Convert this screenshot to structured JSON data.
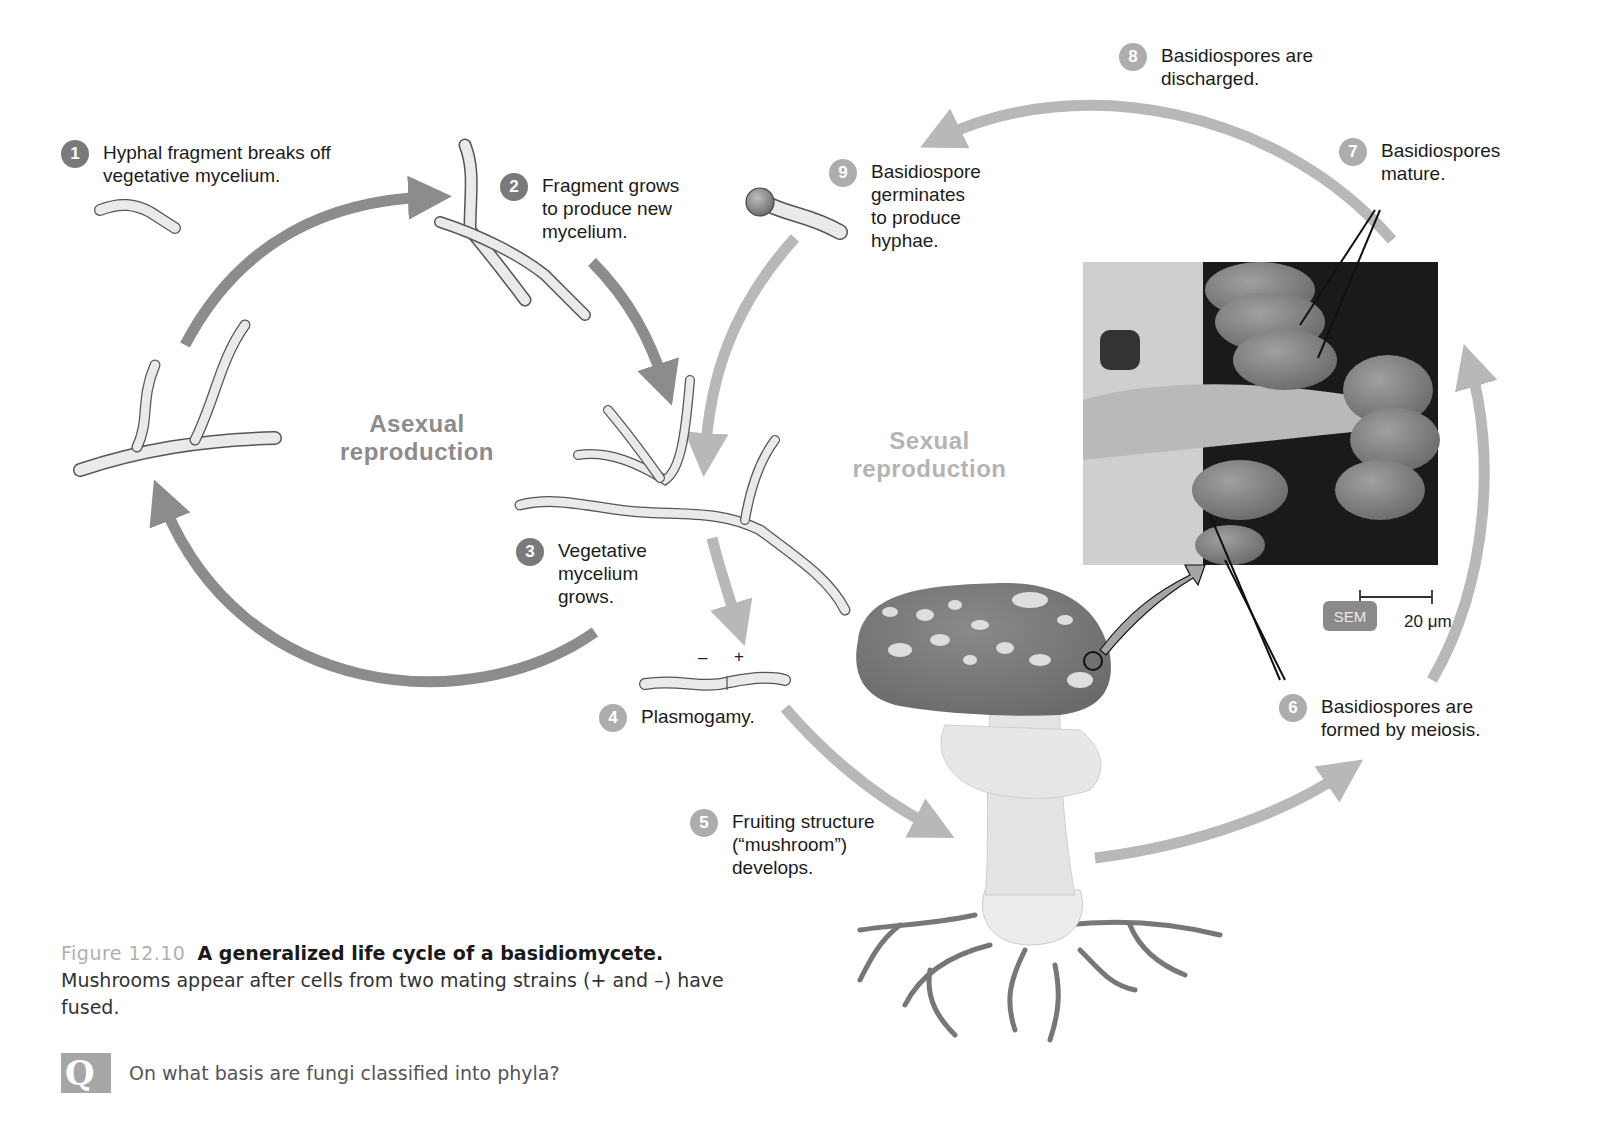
{
  "figure": {
    "steps": [
      {
        "number": "1",
        "text": "Hyphal fragment breaks off\nvegetative mycelium.",
        "phase": "asexual"
      },
      {
        "number": "2",
        "text": "Fragment grows\nto produce new\nmycelium.",
        "phase": "asexual"
      },
      {
        "number": "3",
        "text": "Vegetative\nmycelium\ngrows.",
        "phase": "asexual"
      },
      {
        "number": "4",
        "text": "Plasmogamy.",
        "phase": "sexual"
      },
      {
        "number": "5",
        "text": "Fruiting structure\n(“mushroom”)\ndevelops.",
        "phase": "sexual"
      },
      {
        "number": "6",
        "text": "Basidiospores are\nformed by meiosis.",
        "phase": "sexual"
      },
      {
        "number": "7",
        "text": "Basidiospores\nmature.",
        "phase": "sexual"
      },
      {
        "number": "8",
        "text": "Basidiospores are\ndischarged.",
        "phase": "sexual"
      },
      {
        "number": "9",
        "text": "Basidiospore\ngerminates\nto produce\nhyphae.",
        "phase": "sexual"
      }
    ],
    "phases": {
      "asexual": "Asexual\nreproduction",
      "sexual": "Sexual\nreproduction"
    },
    "mating_signs": {
      "minus": "–",
      "plus": "+"
    },
    "micrograph": {
      "type_badge": "SEM",
      "scale_bar": "20 μm"
    },
    "colors": {
      "asexual_arrow": "#8c8c8c",
      "sexual_arrow": "#b8b8b8",
      "badge_dark": "#7a7a7a",
      "badge_light": "#adadad"
    }
  },
  "caption": {
    "figure_number": "Figure 12.10",
    "title": "A generalized life cycle of a basidiomycete.",
    "body": "Mushrooms appear after cells from two mating strains (+ and –) have fused."
  },
  "question": {
    "icon": "Q",
    "text": "On what basis are fungi classified into phyla?"
  }
}
